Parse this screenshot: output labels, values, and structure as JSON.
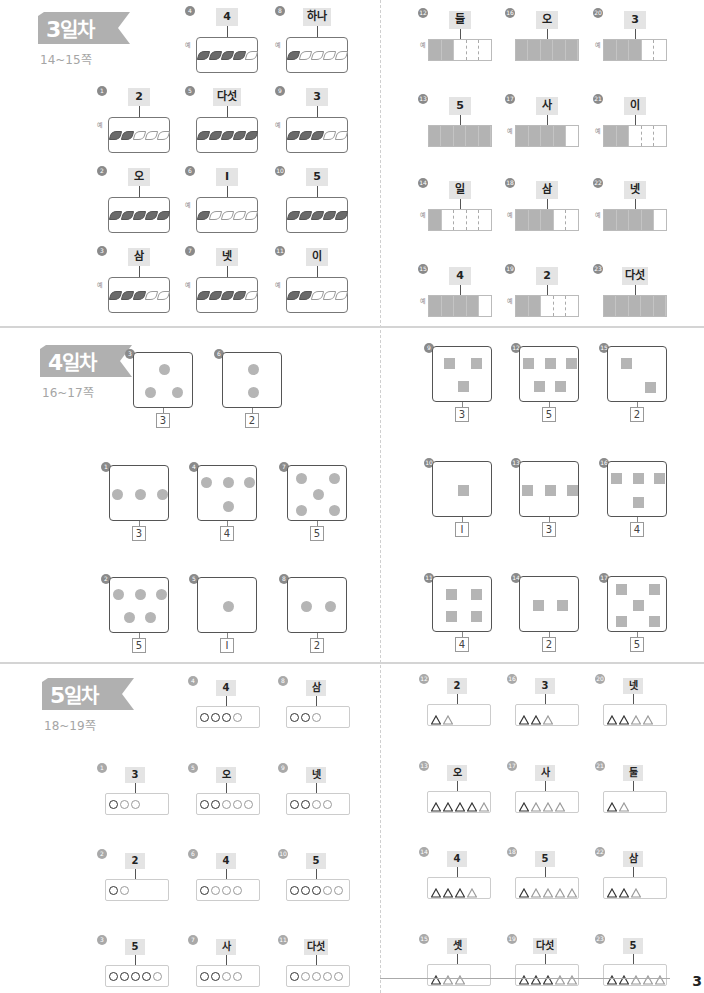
{
  "page_number": "3",
  "colors": {
    "banner": "#b0b0b0",
    "shaded": "#b3b3b3",
    "label_bg": "#e4e4e4",
    "leaf_filled": "#6a6a6a"
  },
  "example_mark": "예",
  "sections": [
    {
      "id": "day3",
      "banner": {
        "num": "3",
        "title": "일차"
      },
      "pages": "14~15쪽",
      "left_type": "leaves",
      "right_type": "bars",
      "left_items": [
        {
          "n": "1",
          "label": "2",
          "filled": 2,
          "example": true
        },
        {
          "n": "2",
          "label": "오",
          "filled": 5,
          "example": false
        },
        {
          "n": "3",
          "label": "삼",
          "filled": 3,
          "example": true
        },
        {
          "n": "4",
          "label": "4",
          "filled": 4,
          "example": true
        },
        {
          "n": "5",
          "label": "다섯",
          "filled": 5,
          "example": false
        },
        {
          "n": "6",
          "label": "I",
          "filled": 1,
          "example": true
        },
        {
          "n": "7",
          "label": "넷",
          "filled": 4,
          "example": true
        },
        {
          "n": "8",
          "label": "하나",
          "filled": 1,
          "example": true
        },
        {
          "n": "9",
          "label": "3",
          "filled": 3,
          "example": true
        },
        {
          "n": "10",
          "label": "5",
          "filled": 5,
          "example": false
        },
        {
          "n": "11",
          "label": "이",
          "filled": 2,
          "example": true
        }
      ],
      "right_items": [
        {
          "n": "12",
          "label": "둘",
          "filled": 2,
          "example": true
        },
        {
          "n": "13",
          "label": "5",
          "filled": 5,
          "example": false
        },
        {
          "n": "14",
          "label": "일",
          "filled": 1,
          "example": true
        },
        {
          "n": "15",
          "label": "4",
          "filled": 4,
          "example": true
        },
        {
          "n": "16",
          "label": "오",
          "filled": 5,
          "example": false
        },
        {
          "n": "17",
          "label": "사",
          "filled": 4,
          "example": true
        },
        {
          "n": "18",
          "label": "삼",
          "filled": 3,
          "example": true
        },
        {
          "n": "19",
          "label": "2",
          "filled": 2,
          "example": true
        },
        {
          "n": "20",
          "label": "3",
          "filled": 3,
          "example": true
        },
        {
          "n": "21",
          "label": "이",
          "filled": 2,
          "example": true
        },
        {
          "n": "22",
          "label": "넷",
          "filled": 4,
          "example": true
        },
        {
          "n": "23",
          "label": "다섯",
          "filled": 5,
          "example": false
        }
      ]
    },
    {
      "id": "day4",
      "banner": {
        "num": "4",
        "title": "일차"
      },
      "pages": "16~17쪽",
      "left_items": [
        {
          "n": "1",
          "answer": "3",
          "count": 3,
          "layout": "row3"
        },
        {
          "n": "2",
          "answer": "5",
          "count": 5,
          "layout": "r3r2"
        },
        {
          "n": "3",
          "answer": "3",
          "count": 3,
          "layout": "tri"
        },
        {
          "n": "4",
          "answer": "4",
          "count": 4,
          "layout": "r3c1"
        },
        {
          "n": "5",
          "answer": "I",
          "count": 1,
          "layout": "center"
        },
        {
          "n": "6",
          "answer": "2",
          "count": 2,
          "layout": "vert2"
        },
        {
          "n": "7",
          "answer": "5",
          "count": 5,
          "layout": "dice5"
        },
        {
          "n": "8",
          "answer": "2",
          "count": 2,
          "layout": "row2"
        }
      ],
      "right_items": [
        {
          "n": "9",
          "answer": "3",
          "count": 3,
          "layout": "tri_inv"
        },
        {
          "n": "10",
          "answer": "I",
          "count": 1,
          "layout": "center"
        },
        {
          "n": "11",
          "answer": "4",
          "count": 4,
          "layout": "grid4"
        },
        {
          "n": "12",
          "answer": "5",
          "count": 5,
          "layout": "r3r2"
        },
        {
          "n": "13",
          "answer": "3",
          "count": 3,
          "layout": "row3"
        },
        {
          "n": "14",
          "answer": "2",
          "count": 2,
          "layout": "row2"
        },
        {
          "n": "15",
          "answer": "2",
          "count": 2,
          "layout": "diag2"
        },
        {
          "n": "16",
          "answer": "4",
          "count": 4,
          "layout": "r3c1"
        },
        {
          "n": "17",
          "answer": "5",
          "count": 5,
          "layout": "dice5"
        }
      ]
    },
    {
      "id": "day5",
      "banner": {
        "num": "5",
        "title": "일차"
      },
      "pages": "18~19쪽",
      "left_items": [
        {
          "n": "1",
          "label": "3",
          "dark": 1,
          "total": 3
        },
        {
          "n": "2",
          "label": "2",
          "dark": 1,
          "total": 2
        },
        {
          "n": "3",
          "label": "5",
          "dark": 4,
          "total": 5
        },
        {
          "n": "4",
          "label": "4",
          "dark": 3,
          "total": 4
        },
        {
          "n": "5",
          "label": "오",
          "dark": 2,
          "total": 5
        },
        {
          "n": "6",
          "label": "4",
          "dark": 1,
          "total": 4
        },
        {
          "n": "7",
          "label": "사",
          "dark": 2,
          "total": 4
        },
        {
          "n": "8",
          "label": "삼",
          "dark": 2,
          "total": 3
        },
        {
          "n": "9",
          "label": "넷",
          "dark": 2,
          "total": 4
        },
        {
          "n": "10",
          "label": "5",
          "dark": 3,
          "total": 5
        },
        {
          "n": "11",
          "label": "다섯",
          "dark": 1,
          "total": 5
        }
      ],
      "right_items": [
        {
          "n": "12",
          "label": "2",
          "dark": 1,
          "total": 2
        },
        {
          "n": "13",
          "label": "오",
          "dark": 4,
          "total": 5
        },
        {
          "n": "14",
          "label": "4",
          "dark": 3,
          "total": 4
        },
        {
          "n": "15",
          "label": "셋",
          "dark": 1,
          "total": 3
        },
        {
          "n": "16",
          "label": "3",
          "dark": 2,
          "total": 3
        },
        {
          "n": "17",
          "label": "사",
          "dark": 1,
          "total": 4
        },
        {
          "n": "18",
          "label": "5",
          "dark": 1,
          "total": 5
        },
        {
          "n": "19",
          "label": "다섯",
          "dark": 3,
          "total": 5
        },
        {
          "n": "20",
          "label": "넷",
          "dark": 2,
          "total": 4
        },
        {
          "n": "21",
          "label": "둘",
          "dark": 1,
          "total": 2
        },
        {
          "n": "22",
          "label": "삼",
          "dark": 2,
          "total": 3
        },
        {
          "n": "23",
          "label": "5",
          "dark": 2,
          "total": 5
        }
      ]
    }
  ]
}
